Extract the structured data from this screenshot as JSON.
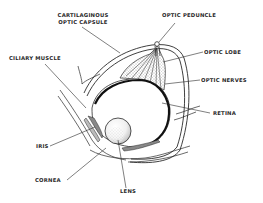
{
  "diagram": {
    "colors": {
      "line": "#2a2a2a",
      "background": "#ffffff"
    },
    "labels": {
      "capsule_line1": "CARTILAGINOUS",
      "capsule_line2": "OPTIC CAPSULE",
      "optic_peduncle": "OPTIC PEDUNCLE",
      "ciliary_muscle": "CILIARY MUSCLE",
      "optic_lobe": "OPTIC LOBE",
      "optic_nerves": "OPTIC NERVES",
      "retina": "RETINA",
      "iris": "IRIS",
      "cornea": "CORNEA",
      "lens": "LENS"
    }
  }
}
